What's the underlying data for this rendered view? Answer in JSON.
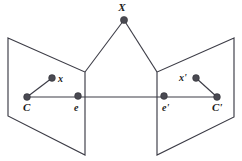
{
  "figure": {
    "background_color": "#ffffff",
    "stroke_color": "#3c3c46",
    "dot_color": "#4a4a52",
    "label_color": "#1a1a1a",
    "width": 242,
    "height": 161
  },
  "labels": {
    "scene_point": "X",
    "left_image_point": "x",
    "left_camera_centre": "C",
    "left_epipole": "e",
    "right_image_point": "x'",
    "right_camera_centre": "C'",
    "right_epipole": "e'"
  },
  "geometry": {
    "scene_point_xy": [
      124,
      20
    ],
    "left_plane_polygon": "8,38 85,72 85,155 8,116",
    "right_plane_polygon": "234,38 157,72 157,155 234,117",
    "left_vertical_edge": [
      85,
      72,
      85,
      155
    ],
    "right_vertical_edge": [
      157,
      72,
      157,
      155
    ],
    "ray_left": [
      124,
      20,
      85,
      72
    ],
    "ray_right": [
      124,
      20,
      157,
      72
    ],
    "baseline": [
      27,
      97,
      217,
      97
    ],
    "left_ray_x": [
      27,
      97,
      52,
      78
    ],
    "right_ray_x": [
      217,
      97,
      196,
      78
    ],
    "dots": [
      {
        "name": "X",
        "cx": 124,
        "cy": 20,
        "r": 3.6
      },
      {
        "name": "x",
        "cx": 52,
        "cy": 78,
        "r": 3.4
      },
      {
        "name": "C",
        "cx": 27,
        "cy": 97,
        "r": 3.4
      },
      {
        "name": "e",
        "cx": 78,
        "cy": 96,
        "r": 3.4
      },
      {
        "name": "e-prime",
        "cx": 164,
        "cy": 96,
        "r": 3.4
      },
      {
        "name": "C-prime",
        "cx": 217,
        "cy": 97,
        "r": 3.4
      },
      {
        "name": "x-prime",
        "cx": 196,
        "cy": 78,
        "r": 3.4
      }
    ],
    "label_positions": {
      "scene_point": [
        122,
        11
      ],
      "left_image_point": [
        58,
        82
      ],
      "left_camera_centre": [
        23,
        110
      ],
      "left_epipole": [
        75,
        110
      ],
      "right_image_point": [
        181,
        81
      ],
      "right_camera_centre": [
        214,
        110
      ],
      "right_epipole": [
        164,
        110
      ]
    }
  }
}
